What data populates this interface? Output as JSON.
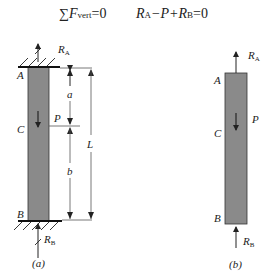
{
  "equation": {
    "left": {
      "sigma": "∑",
      "symbol": "F",
      "subscript": "vert",
      "rhs": "=0"
    },
    "right": {
      "r_a": "R",
      "r_a_sub": "A",
      "minus_p": "−P+",
      "r_b": "R",
      "r_b_sub": "B",
      "rhs": "=0"
    }
  },
  "figure_a": {
    "caption": "(a)",
    "labels": {
      "A": "A",
      "B": "B",
      "C": "C",
      "P": "P",
      "a": "a",
      "b": "b",
      "L": "L",
      "RA": "R",
      "RA_sub": "A",
      "RB": "R",
      "RB_sub": "B"
    }
  },
  "figure_b": {
    "caption": "(b)",
    "labels": {
      "A": "A",
      "B": "B",
      "C": "C",
      "P": "P",
      "RA": "R",
      "RA_sub": "A",
      "RB": "R",
      "RB_sub": "B"
    }
  },
  "colors": {
    "bar_fill": "#8a8a8a",
    "line": "#222222",
    "dim_line": "#555555"
  }
}
